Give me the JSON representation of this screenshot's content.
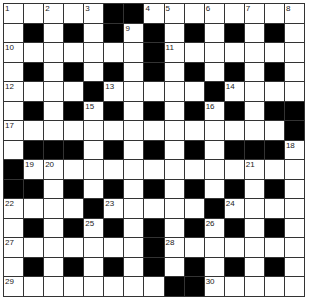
{
  "puzzle": {
    "rows": 15,
    "cols": 15,
    "colors": {
      "block": "#000000",
      "cell": "#ffffff",
      "line": "#333333"
    },
    "grid": [
      "WWWWWBBWWWWWWWW",
      "WBWBWBWBWBWBWBW",
      "WWWWWWWBWWWWWWW",
      "WBWBWBWBWBWBWBW",
      "WWWWBWWWWWBWWWW",
      "WBWBWBWBWBWBWBB",
      "WWWWWWWWWWWWWWB",
      "WBBBWBWBWBWBBBW",
      "BWWWWWWWWWWWWWW",
      "BBWBWBWBWBWBWBW",
      "WWWWBWWWWWBWWWW",
      "WBWBWBWBWBWBWBW",
      "WWWWWWWBWWWWWWW",
      "WBWBWBWBWBWBWBW",
      "WWWWWWWWBBWWWWW"
    ],
    "numbers": [
      {
        "r": 0,
        "c": 0,
        "n": "1"
      },
      {
        "r": 0,
        "c": 2,
        "n": "2"
      },
      {
        "r": 0,
        "c": 4,
        "n": "3"
      },
      {
        "r": 0,
        "c": 7,
        "n": "4"
      },
      {
        "r": 0,
        "c": 8,
        "n": "5"
      },
      {
        "r": 0,
        "c": 10,
        "n": "6"
      },
      {
        "r": 0,
        "c": 12,
        "n": "7"
      },
      {
        "r": 0,
        "c": 14,
        "n": "8"
      },
      {
        "r": 1,
        "c": 6,
        "n": "9"
      },
      {
        "r": 2,
        "c": 0,
        "n": "10"
      },
      {
        "r": 2,
        "c": 8,
        "n": "11"
      },
      {
        "r": 4,
        "c": 0,
        "n": "12"
      },
      {
        "r": 4,
        "c": 5,
        "n": "13"
      },
      {
        "r": 4,
        "c": 11,
        "n": "14"
      },
      {
        "r": 5,
        "c": 4,
        "n": "15"
      },
      {
        "r": 5,
        "c": 10,
        "n": "16"
      },
      {
        "r": 6,
        "c": 0,
        "n": "17"
      },
      {
        "r": 7,
        "c": 14,
        "n": "18"
      },
      {
        "r": 8,
        "c": 1,
        "n": "19"
      },
      {
        "r": 8,
        "c": 2,
        "n": "20"
      },
      {
        "r": 8,
        "c": 12,
        "n": "21"
      },
      {
        "r": 10,
        "c": 0,
        "n": "22"
      },
      {
        "r": 10,
        "c": 5,
        "n": "23"
      },
      {
        "r": 10,
        "c": 11,
        "n": "24"
      },
      {
        "r": 11,
        "c": 4,
        "n": "25"
      },
      {
        "r": 11,
        "c": 10,
        "n": "26"
      },
      {
        "r": 12,
        "c": 0,
        "n": "27"
      },
      {
        "r": 12,
        "c": 8,
        "n": "28"
      },
      {
        "r": 14,
        "c": 0,
        "n": "29"
      },
      {
        "r": 14,
        "c": 10,
        "n": "30"
      }
    ]
  }
}
